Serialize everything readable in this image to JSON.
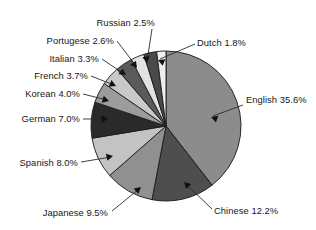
{
  "chart_data": {
    "type": "pie",
    "title": "",
    "subtitle": "",
    "xlabel": "",
    "ylabel": "",
    "legend_position": "none",
    "grid": false,
    "label_format": "{name} {value}%",
    "start_angle_deg": 0,
    "direction": "clockwise",
    "units": "percent",
    "categories": [
      "English",
      "Chinese",
      "Japanese",
      "Spanish",
      "German",
      "Korean",
      "French",
      "Italian",
      "Portugese",
      "Russian",
      "Dutch"
    ],
    "values": [
      35.6,
      12.2,
      9.5,
      8.0,
      7.0,
      4.0,
      3.7,
      3.3,
      2.6,
      2.5,
      1.8
    ],
    "slices": [
      {
        "name": "English",
        "value": 35.6,
        "label": "English 35.6%",
        "color": "#8c8c8c",
        "label_x": 246,
        "label_y": 103,
        "anchor": "start",
        "leader": [
          [
            243,
            105
          ],
          [
            213,
            116
          ]
        ],
        "arrow_at": [
          211,
          117
        ],
        "arrow_dir": 200
      },
      {
        "name": "Chinese",
        "value": 12.2,
        "label": "Chinese 12.2%",
        "color": "#4e4e4e",
        "label_x": 214,
        "label_y": 214,
        "anchor": "start",
        "leader": [
          [
            212,
            209
          ],
          [
            186,
            184
          ]
        ],
        "arrow_at": [
          184,
          182
        ],
        "arrow_dir": 224
      },
      {
        "name": "Japanese",
        "value": 9.5,
        "label": "Japanese 9.5%",
        "color": "#909090",
        "label_x": 108,
        "label_y": 216,
        "anchor": "end",
        "leader": [
          [
            112,
            211
          ],
          [
            139,
            189
          ]
        ],
        "arrow_at": [
          141,
          187
        ],
        "arrow_dir": 320
      },
      {
        "name": "Spanish",
        "value": 8.0,
        "label": "Spanish 8.0%",
        "color": "#c3c3c3",
        "label_x": 78,
        "label_y": 166,
        "anchor": "end",
        "leader": [
          [
            81,
            162
          ],
          [
            111,
            157
          ]
        ],
        "arrow_at": [
          113,
          156
        ],
        "arrow_dir": 348
      },
      {
        "name": "German",
        "value": 7.0,
        "label": "German 7.0%",
        "color": "#2a2a2a",
        "label_x": 80,
        "label_y": 122,
        "anchor": "end",
        "leader": [
          [
            83,
            119
          ],
          [
            106,
            119
          ]
        ],
        "arrow_at": [
          108,
          119
        ],
        "arrow_dir": 0
      },
      {
        "name": "Korean",
        "value": 4.0,
        "label": "Korean 4.0%",
        "color": "#9c9c9c",
        "label_x": 80,
        "label_y": 97,
        "anchor": "end",
        "leader": [
          [
            83,
            94
          ],
          [
            107,
            100
          ]
        ],
        "arrow_at": [
          109,
          101
        ],
        "arrow_dir": 16
      },
      {
        "name": "French",
        "value": 3.7,
        "label": "French 3.7%",
        "color": "#c9c9c9",
        "label_x": 88,
        "label_y": 79,
        "anchor": "end",
        "leader": [
          [
            91,
            76
          ],
          [
            114,
            85
          ]
        ],
        "arrow_at": [
          116,
          86
        ],
        "arrow_dir": 24
      },
      {
        "name": "Italian",
        "value": 3.3,
        "label": "Italian 3.3%",
        "color": "#5a5a5a",
        "label_x": 99,
        "label_y": 62,
        "anchor": "end",
        "leader": [
          [
            102,
            59
          ],
          [
            124,
            74
          ]
        ],
        "arrow_at": [
          126,
          75
        ],
        "arrow_dir": 34
      },
      {
        "name": "Portugese",
        "value": 2.6,
        "label": "Portugese 2.6%",
        "color": "#e2e2e2",
        "label_x": 114,
        "label_y": 44,
        "anchor": "end",
        "leader": [
          [
            117,
            41
          ],
          [
            136,
            66
          ]
        ],
        "arrow_at": [
          137,
          68
        ],
        "arrow_dir": 53
      },
      {
        "name": "Russian",
        "value": 2.5,
        "label": "Russian 2.5%",
        "color": "#4a4a4a",
        "label_x": 155,
        "label_y": 26,
        "anchor": "end",
        "leader": [
          [
            152,
            29
          ],
          [
            147,
            61
          ]
        ],
        "arrow_at": [
          147,
          63
        ],
        "arrow_dir": 81
      },
      {
        "name": "Dutch",
        "value": 1.8,
        "label": "Dutch 1.8%",
        "color": "#eeeeee",
        "label_x": 197,
        "label_y": 46,
        "anchor": "start",
        "leader": [
          [
            195,
            44
          ],
          [
            160,
            59
          ]
        ],
        "arrow_at": [
          158,
          60
        ],
        "arrow_dir": 203
      }
    ],
    "geometry": {
      "cx": 166,
      "cy": 126,
      "r": 75
    }
  }
}
